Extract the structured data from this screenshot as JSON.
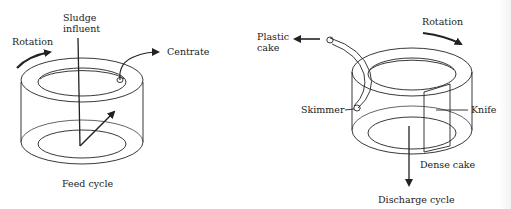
{
  "figure": {
    "left_panel": {
      "caption": "Feed cycle",
      "labels": {
        "rotation": "Rotation",
        "sludge_line1": "Sludge",
        "sludge_line2": "influent",
        "centrate": "Centrate"
      }
    },
    "right_panel": {
      "caption": "Discharge cycle",
      "labels": {
        "rotation": "Rotation",
        "plastic_line1": "Plastic",
        "plastic_line2": "cake",
        "skimmer": "Skimmer",
        "knife": "Knife",
        "dense_cake": "Dense cake"
      }
    },
    "colors": {
      "ink": "#222222",
      "background": "#ffffff"
    }
  }
}
